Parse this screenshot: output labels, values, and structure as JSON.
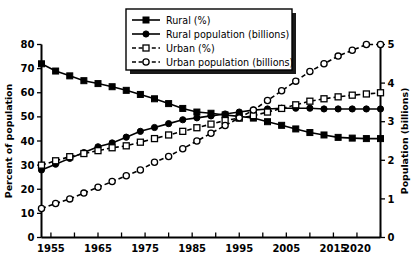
{
  "chart_data": {
    "type": "line",
    "title": "",
    "xlabel": "",
    "ylabel": "Percent of population",
    "y2label": "Population (billions)",
    "xlim": [
      1953,
      2025
    ],
    "ylim": [
      0,
      80
    ],
    "y2lim": [
      0,
      5
    ],
    "grid": false,
    "legend_position": "top-center",
    "xticks_major": [
      1955,
      1965,
      1975,
      1985,
      1995,
      2005,
      2015,
      2020
    ],
    "xticks_minor": [
      1955,
      1960,
      1965,
      1970,
      1975,
      1980,
      1985,
      1990,
      1995,
      2000,
      2005,
      2010,
      2015,
      2020,
      2025
    ],
    "xtick_labels": [
      "1955",
      "1965",
      "1975",
      "1985",
      "1995",
      "2005",
      "2015",
      "2020"
    ],
    "yticks": [
      0,
      10,
      20,
      30,
      40,
      50,
      60,
      70,
      80
    ],
    "ytick_labels": [
      "0",
      "10",
      "20",
      "30",
      "40",
      "50",
      "60",
      "70",
      "80"
    ],
    "y2ticks": [
      0,
      1,
      2,
      3,
      4,
      5
    ],
    "y2tick_labels": [
      "0",
      "1",
      "2",
      "3",
      "4",
      "5"
    ],
    "x": [
      1953,
      1956,
      1959,
      1962,
      1965,
      1968,
      1971,
      1974,
      1977,
      1980,
      1983,
      1986,
      1989,
      1992,
      1995,
      1998,
      2001,
      2004,
      2007,
      2010,
      2013,
      2016,
      2019,
      2022,
      2025
    ],
    "series": [
      {
        "name": "Rural (%)",
        "axis": "left",
        "marker": "filled-square",
        "linestyle": "solid",
        "color": "#000000",
        "values": [
          72.0,
          69.0,
          67.0,
          65.0,
          63.8,
          62.5,
          61.0,
          59.3,
          57.5,
          55.5,
          53.5,
          52.0,
          51.5,
          50.8,
          50.2,
          49.5,
          48.0,
          46.5,
          45.0,
          43.5,
          42.5,
          41.5,
          41.2,
          41.0,
          41.0
        ]
      },
      {
        "name": "Rural population (billions)",
        "axis": "right",
        "marker": "filled-circle",
        "linestyle": "solid",
        "color": "#000000",
        "values": [
          1.75,
          1.9,
          2.05,
          2.2,
          2.35,
          2.45,
          2.6,
          2.75,
          2.85,
          2.95,
          3.05,
          3.1,
          3.15,
          3.2,
          3.25,
          3.3,
          3.33,
          3.35,
          3.35,
          3.35,
          3.33,
          3.33,
          3.33,
          3.33,
          3.33
        ]
      },
      {
        "name": "Urban (%)",
        "axis": "left",
        "marker": "open-square",
        "linestyle": "dashed",
        "color": "#000000",
        "values": [
          30.0,
          31.8,
          33.5,
          34.8,
          36.0,
          37.2,
          38.0,
          39.5,
          41.0,
          42.5,
          44.0,
          45.5,
          47.0,
          48.5,
          49.5,
          50.5,
          52.0,
          53.5,
          55.0,
          56.5,
          57.5,
          58.3,
          59.0,
          59.5,
          60.0
        ]
      },
      {
        "name": "Urban population (billions)",
        "axis": "right",
        "marker": "open-circle",
        "linestyle": "dashed",
        "color": "#000000",
        "values": [
          0.75,
          0.88,
          1.0,
          1.15,
          1.3,
          1.45,
          1.6,
          1.75,
          1.95,
          2.1,
          2.3,
          2.5,
          2.7,
          2.9,
          3.1,
          3.3,
          3.55,
          3.8,
          4.05,
          4.3,
          4.5,
          4.7,
          4.85,
          5.0,
          5.0
        ]
      }
    ],
    "legend": [
      {
        "label": "Rural (%)",
        "marker": "filled-square",
        "linestyle": "solid"
      },
      {
        "label": "Rural population (billions)",
        "marker": "filled-circle",
        "linestyle": "solid"
      },
      {
        "label": "Urban (%)",
        "marker": "open-square",
        "linestyle": "dashed"
      },
      {
        "label": "Urban population (billions)",
        "marker": "open-circle",
        "linestyle": "dashed"
      }
    ]
  }
}
